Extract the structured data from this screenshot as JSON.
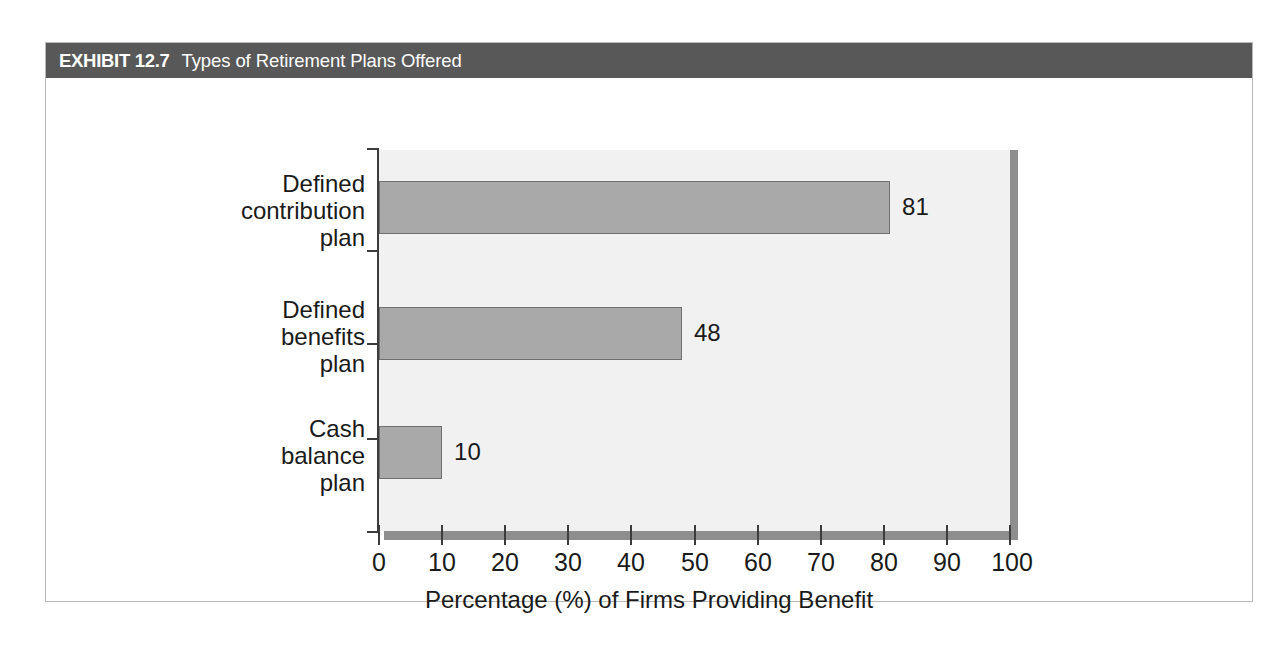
{
  "exhibit": {
    "number": "EXHIBIT 12.7",
    "title": "Types of Retirement Plans Offered"
  },
  "colors": {
    "title_bar": "#585858",
    "title_text": "#ffffff",
    "bar_fill": "#a9a9a9",
    "bar_border": "#6f6f6f",
    "plot_background": "#f1f1f1",
    "shadow": "#8e8e8e",
    "axis": "#3c3c3c",
    "frame_border": "#b9b9b9",
    "text": "#1a1a1a"
  },
  "chart_data": {
    "type": "bar",
    "orientation": "horizontal",
    "title": "Types of Retirement Plans Offered",
    "categories": [
      "Defined contribution plan",
      "Defined benefits plan",
      "Cash balance plan"
    ],
    "category_lines": [
      [
        "Defined",
        "contribution",
        "plan"
      ],
      [
        "Defined",
        "benefits",
        "plan"
      ],
      [
        "Cash",
        "balance",
        "plan"
      ]
    ],
    "values": [
      81,
      48,
      10
    ],
    "value_labels": [
      "81",
      "48",
      "10"
    ],
    "xlabel": "Percentage (%) of Firms Providing Benefit",
    "ylabel": "",
    "xlim": [
      0,
      100
    ],
    "xticks": [
      0,
      10,
      20,
      30,
      40,
      50,
      60,
      70,
      80,
      90,
      100
    ],
    "xtick_labels": [
      "0",
      "10",
      "20",
      "30",
      "40",
      "50",
      "60",
      "70",
      "80",
      "90",
      "100"
    ],
    "grid": false,
    "legend": false
  }
}
